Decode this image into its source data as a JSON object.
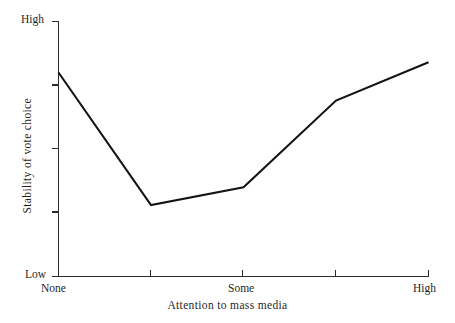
{
  "chart_data": {
    "type": "line",
    "title": "",
    "xlabel": "Attention to mass media",
    "ylabel": "Stability of vote choice",
    "x": [
      1,
      2,
      3,
      4,
      5
    ],
    "categories": [
      "None",
      "",
      "Some",
      "",
      "High"
    ],
    "values": [
      0.8,
      0.28,
      0.35,
      0.69,
      0.84
    ],
    "xtick_labels": [
      "None",
      "Some",
      "High"
    ],
    "xtick_label_positions": [
      1,
      3,
      5
    ],
    "ytick_labels": [
      "Low",
      "High"
    ],
    "ylim": [
      0,
      1
    ],
    "xlim": [
      1,
      5
    ],
    "grid": false,
    "legend": false,
    "series": [
      {
        "name": "Stability of vote choice",
        "values": [
          0.8,
          0.28,
          0.35,
          0.69,
          0.84
        ]
      }
    ],
    "line_color": "#141414",
    "background_color": "#ffffff"
  },
  "axes": {
    "y": {
      "top_label": "High",
      "bottom_label": "Low",
      "title": "Stability of vote choice",
      "tick_count": 5
    },
    "x": {
      "title": "Attention to mass media",
      "labels": {
        "start": "None",
        "middle": "Some",
        "end": "High"
      },
      "tick_count": 5
    }
  },
  "artifacts": {
    "top_edge_text": ""
  }
}
